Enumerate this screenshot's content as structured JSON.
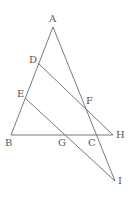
{
  "diagram": {
    "type": "geometry",
    "points": {
      "A": {
        "label": "A",
        "x": 53,
        "y": 27
      },
      "B": {
        "label": "B",
        "x": 11,
        "y": 135
      },
      "C": {
        "label": "C",
        "x": 95,
        "y": 135
      },
      "D": {
        "label": "D",
        "x": 38,
        "y": 63
      },
      "E": {
        "label": "E",
        "x": 25,
        "y": 98
      },
      "F": {
        "label": "F",
        "x": 85,
        "y": 107
      },
      "G": {
        "label": "G",
        "x": 66,
        "y": 135
      },
      "H": {
        "label": "H",
        "x": 113,
        "y": 135
      },
      "I": {
        "label": "I",
        "x": 115,
        "y": 181
      }
    },
    "segments": [
      {
        "from": "A",
        "to": "B"
      },
      {
        "from": "A",
        "to": "I"
      },
      {
        "from": "B",
        "to": "H"
      },
      {
        "from": "D",
        "to": "H"
      },
      {
        "from": "E",
        "to": "I"
      }
    ],
    "colors": {
      "line": "#6a6a6a",
      "label": "#5a5a5a",
      "background": "#ffffff"
    }
  }
}
